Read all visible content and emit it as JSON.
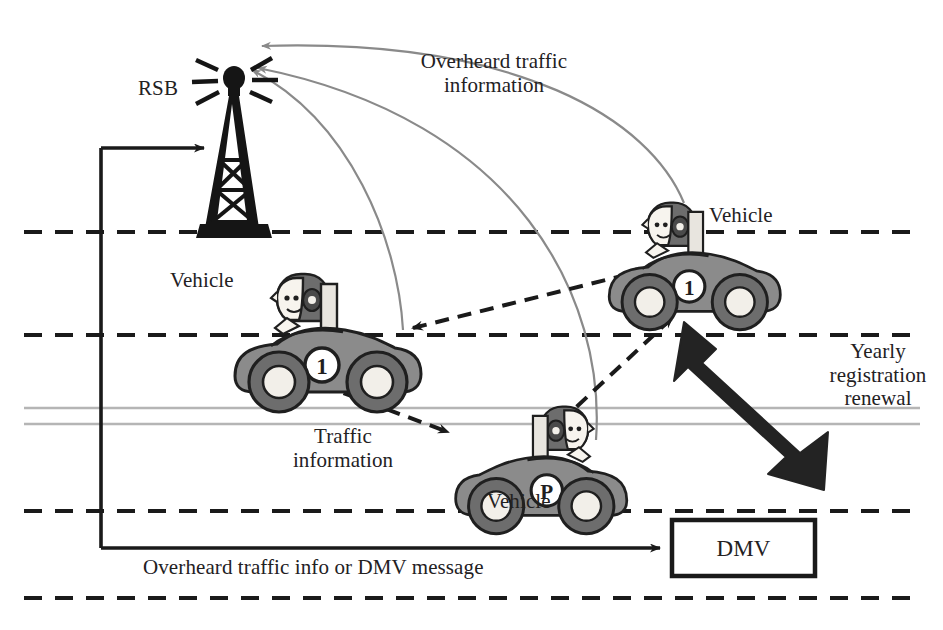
{
  "diagram": {
    "type": "vehicular-network-illustration",
    "canvas": {
      "width": 943,
      "height": 630,
      "background": "#ffffff"
    }
  },
  "colors": {
    "ink": "#1a1a1a",
    "text": "#23211f",
    "vehicle_body": "#8b8b8b",
    "vehicle_outline": "#1f1f1f",
    "vehicle_dark": "#6d6d6d",
    "wheel_dark": "#4a4a4a",
    "gray_arrow": "#8a8a8a",
    "road_dash": "#1a1a1a",
    "road_solid_gray": "#b5b5b5",
    "skin": "#f7f4ee",
    "black_arrow": "#232323"
  },
  "labels": {
    "rsb": "RSB",
    "overheard_traffic_line1": "Overheard traffic",
    "overheard_traffic_line2": "information",
    "vehicle_top": "Vehicle",
    "vehicle_left": "Vehicle",
    "vehicle_bottom": "Vehicle",
    "yearly_line1": "Yearly",
    "yearly_line2": "registration",
    "yearly_line3": "renewal",
    "traffic_line1": "Traffic",
    "traffic_line2": "information",
    "dmv": "DMV",
    "bottom_caption": "Overheard traffic info or DMV message"
  },
  "nodes": {
    "rsb_tower": {
      "name": "RSB",
      "x": 232,
      "y": 80,
      "description": "roadside base station tower with radiating antenna"
    },
    "dmv_box": {
      "name": "DMV",
      "x": 672,
      "y": 520,
      "width": 143,
      "height": 56
    },
    "vehicle_1": {
      "name": "Vehicle",
      "badge": "1",
      "x": 225,
      "y": 265,
      "facing": "left"
    },
    "vehicle_2": {
      "name": "Vehicle",
      "badge": "1",
      "x": 605,
      "y": 195,
      "facing": "left"
    },
    "vehicle_3": {
      "name": "Vehicle",
      "badge": "P",
      "x": 440,
      "y": 400,
      "facing": "right"
    }
  },
  "roads": {
    "lane_lines": [
      {
        "kind": "dashed",
        "y": 232
      },
      {
        "kind": "dashed",
        "y": 335
      },
      {
        "kind": "solid-gray",
        "y": 408
      },
      {
        "kind": "solid-gray",
        "y": 424
      },
      {
        "kind": "dashed",
        "y": 511
      },
      {
        "kind": "dashed",
        "y": 598
      }
    ]
  },
  "connections": [
    {
      "from": "vehicle_2",
      "to": "rsb_tower",
      "style": "gray-curve-arrow",
      "label": "Overheard traffic information"
    },
    {
      "from": "vehicle_3",
      "to": "rsb_tower",
      "style": "gray-curve-arrow",
      "label": "Overheard traffic information"
    },
    {
      "from": "vehicle_1",
      "to": "rsb_tower",
      "style": "gray-curve-arrow",
      "label": "Overheard traffic information"
    },
    {
      "from": "vehicle_1",
      "to": "vehicle_2",
      "style": "dashed-double-arrow",
      "label": ""
    },
    {
      "from": "vehicle_1",
      "to": "vehicle_3",
      "style": "dashed-double-arrow",
      "label": "Traffic information"
    },
    {
      "from": "vehicle_3",
      "to": "vehicle_2",
      "style": "dashed-double-arrow",
      "label": ""
    },
    {
      "from": "vehicle_2",
      "to": "dmv_box",
      "style": "thick-black-double-arrow",
      "label": "Yearly registration renewal"
    },
    {
      "from": "rsb_tower",
      "to": "dmv_box",
      "style": "black-polyline-arrow",
      "label": "Overheard traffic info or DMV message"
    }
  ]
}
